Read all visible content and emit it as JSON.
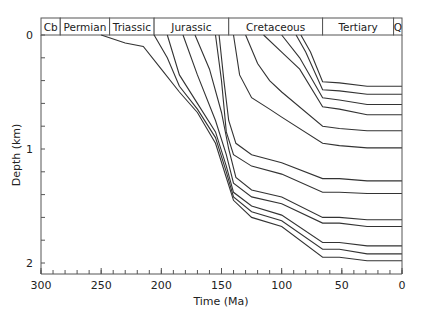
{
  "chart_data": {
    "type": "line",
    "title": "",
    "xlabel": "Time (Ma)",
    "ylabel": "Depth (km)",
    "xlim": [
      300,
      0
    ],
    "ylim": [
      0,
      2
    ],
    "x_reversed": true,
    "y_reversed": true,
    "grid": false,
    "legend": null,
    "x_ticks": [
      300,
      250,
      200,
      150,
      100,
      50,
      0
    ],
    "x_minor_tick_step": 10,
    "y_ticks": [
      0,
      1,
      2
    ],
    "y_minor_tick_step": 0.2,
    "periods": [
      {
        "label": "Cb",
        "start": 300,
        "end": 284
      },
      {
        "label": "Permian",
        "start": 284,
        "end": 243
      },
      {
        "label": "Triassic",
        "start": 243,
        "end": 206
      },
      {
        "label": "Jurassic",
        "start": 206,
        "end": 144
      },
      {
        "label": "Cretaceous",
        "start": 144,
        "end": 66
      },
      {
        "label": "Tertiary",
        "start": 66,
        "end": 7
      },
      {
        "label": "Q",
        "start": 7,
        "end": 0
      }
    ],
    "series": [
      {
        "name": "horizon-1",
        "x": [
          250,
          230,
          215,
          200,
          185,
          170,
          155,
          146,
          140,
          125,
          100,
          66,
          52,
          29,
          0
        ],
        "y": [
          0,
          0.07,
          0.1,
          0.3,
          0.5,
          0.68,
          0.95,
          1.25,
          1.45,
          1.6,
          1.68,
          1.95,
          1.95,
          1.98,
          1.98
        ]
      },
      {
        "name": "horizon-2",
        "x": [
          206,
          195,
          185,
          170,
          155,
          146,
          140,
          125,
          100,
          66,
          52,
          29,
          0
        ],
        "y": [
          0,
          0.2,
          0.45,
          0.65,
          0.9,
          1.2,
          1.42,
          1.55,
          1.63,
          1.88,
          1.88,
          1.92,
          1.92
        ]
      },
      {
        "name": "horizon-3",
        "x": [
          195,
          185,
          170,
          155,
          146,
          140,
          125,
          100,
          66,
          52,
          29,
          0
        ],
        "y": [
          0,
          0.35,
          0.6,
          0.85,
          1.15,
          1.38,
          1.5,
          1.58,
          1.82,
          1.82,
          1.85,
          1.85
        ]
      },
      {
        "name": "horizon-4",
        "x": [
          182,
          170,
          155,
          146,
          140,
          125,
          100,
          66,
          52,
          29,
          0
        ],
        "y": [
          0,
          0.35,
          0.75,
          1.05,
          1.3,
          1.42,
          1.48,
          1.65,
          1.65,
          1.68,
          1.68
        ]
      },
      {
        "name": "horizon-5",
        "x": [
          172,
          160,
          150,
          144,
          138,
          125,
          100,
          66,
          52,
          29,
          0
        ],
        "y": [
          0,
          0.3,
          0.68,
          1.0,
          1.25,
          1.36,
          1.42,
          1.6,
          1.6,
          1.62,
          1.62
        ]
      },
      {
        "name": "horizon-6",
        "x": [
          155,
          150,
          146,
          140,
          125,
          100,
          66,
          52,
          29,
          0
        ],
        "y": [
          0,
          0.4,
          0.85,
          1.05,
          1.15,
          1.22,
          1.38,
          1.38,
          1.39,
          1.39
        ]
      },
      {
        "name": "horizon-7",
        "x": [
          152,
          148,
          144,
          138,
          125,
          100,
          66,
          52,
          29,
          0
        ],
        "y": [
          0,
          0.4,
          0.75,
          0.95,
          1.05,
          1.12,
          1.26,
          1.26,
          1.28,
          1.28
        ]
      },
      {
        "name": "horizon-8",
        "x": [
          140,
          135,
          125,
          110,
          100,
          66,
          52,
          29,
          0
        ],
        "y": [
          0,
          0.35,
          0.55,
          0.65,
          0.72,
          0.95,
          0.97,
          0.99,
          0.99
        ]
      },
      {
        "name": "horizon-9",
        "x": [
          130,
          120,
          110,
          100,
          66,
          52,
          29,
          0
        ],
        "y": [
          0,
          0.25,
          0.4,
          0.5,
          0.8,
          0.82,
          0.84,
          0.84
        ]
      },
      {
        "name": "horizon-10",
        "x": [
          115,
          100,
          85,
          66,
          52,
          29,
          0
        ],
        "y": [
          0,
          0.15,
          0.3,
          0.63,
          0.65,
          0.7,
          0.7
        ]
      },
      {
        "name": "horizon-11",
        "x": [
          100,
          85,
          66,
          52,
          29,
          0
        ],
        "y": [
          0,
          0.2,
          0.55,
          0.57,
          0.61,
          0.61
        ]
      },
      {
        "name": "horizon-12",
        "x": [
          88,
          80,
          66,
          52,
          29,
          0
        ],
        "y": [
          0,
          0.15,
          0.48,
          0.49,
          0.52,
          0.52
        ]
      },
      {
        "name": "horizon-13",
        "x": [
          84,
          76,
          66,
          52,
          29,
          0
        ],
        "y": [
          0,
          0.15,
          0.41,
          0.42,
          0.45,
          0.45
        ]
      }
    ]
  }
}
